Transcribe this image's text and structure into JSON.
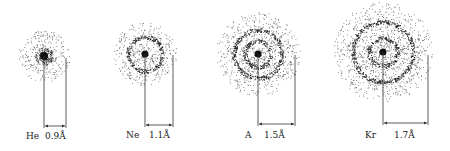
{
  "figure": {
    "atoms": [
      {
        "symbol": "He",
        "radius_label": "0.9Å",
        "cx": 44,
        "cy": 56,
        "line_right_x": 66,
        "line_top": 58,
        "arrow_y": 126,
        "cloud_r": 26,
        "rings": [],
        "core_r": 4,
        "sym_x": 26,
        "rad_x": 45,
        "label_y": 132
      },
      {
        "symbol": "Ne",
        "radius_label": "1.1Å",
        "cx": 145,
        "cy": 54,
        "line_right_x": 173,
        "line_top": 55,
        "arrow_y": 125,
        "cloud_r": 32,
        "rings": [
          17
        ],
        "core_r": 3.5,
        "sym_x": 126,
        "rad_x": 149,
        "label_y": 131
      },
      {
        "symbol": "A",
        "radius_label": "1.5Å",
        "cx": 258,
        "cy": 54,
        "line_right_x": 295,
        "line_top": 55,
        "arrow_y": 124,
        "cloud_r": 42,
        "rings": [
          13,
          24
        ],
        "core_r": 3.5,
        "sym_x": 245,
        "rad_x": 264,
        "label_y": 131
      },
      {
        "symbol": "Kr",
        "radius_label": "1.7Å",
        "cx": 383,
        "cy": 52,
        "line_right_x": 428,
        "line_top": 55,
        "arrow_y": 123,
        "cloud_r": 50,
        "rings": [
          14,
          30
        ],
        "core_r": 3.5,
        "sym_x": 365,
        "rad_x": 394,
        "label_y": 131
      }
    ]
  }
}
